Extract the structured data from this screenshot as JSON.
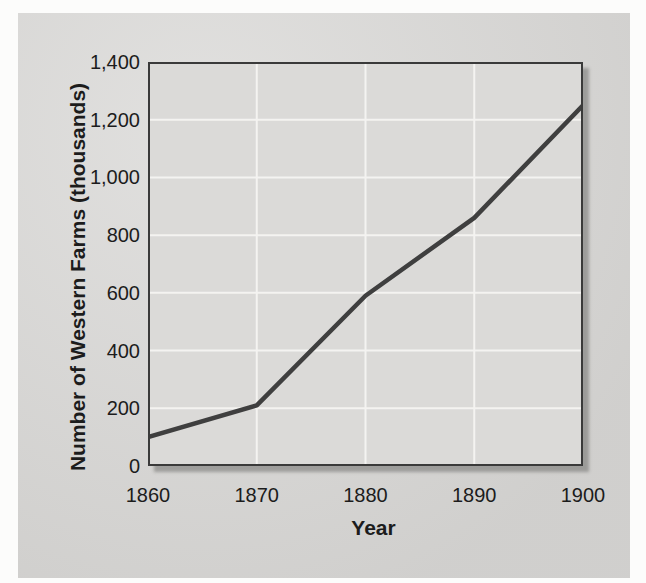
{
  "colors": {
    "page_bg": "#fcfcfb",
    "panel_bg": "#d7d6d4",
    "plot_bg": "#dbdad8",
    "grid": "#f4f3f1",
    "border": "#3a3a3a",
    "line": "#3f3f3f",
    "text": "#1c1c1c"
  },
  "chart_data": {
    "type": "line",
    "title": "",
    "xlabel": "Year",
    "ylabel": "Number of Western Farms (thousands)",
    "x": [
      1860,
      1870,
      1880,
      1890,
      1900
    ],
    "x_tick_labels": [
      "1860",
      "1870",
      "1880",
      "1890",
      "1900"
    ],
    "values": [
      100,
      210,
      590,
      860,
      1250
    ],
    "series_name": "Number of Western Farms (thousands)",
    "xlim": [
      1860,
      1900
    ],
    "ylim": [
      0,
      1400
    ],
    "y_ticks": [
      0,
      200,
      400,
      600,
      800,
      1000,
      1200,
      1400
    ],
    "y_tick_labels": [
      "0",
      "200",
      "400",
      "600",
      "800",
      "1,000",
      "1,200",
      "1,400"
    ],
    "grid": "on",
    "grid_color_note": "white gridlines on light gray plot background",
    "legend_position": "none"
  }
}
